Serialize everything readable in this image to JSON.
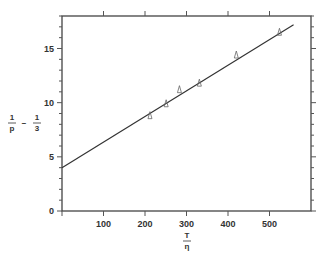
{
  "chart_data": {
    "type": "scatter",
    "title": "",
    "xlabel": {
      "numerator": "T",
      "denominator": "η"
    },
    "ylabel": {
      "term1_num": "1",
      "term1_den": "p",
      "operator": "−",
      "term2_num": "1",
      "term2_den": "3"
    },
    "xlim": [
      0,
      600
    ],
    "ylim": [
      0,
      18
    ],
    "xticks": [
      100,
      200,
      300,
      400,
      500
    ],
    "xtick_labels": [
      "100",
      "200",
      "300",
      "400",
      "500"
    ],
    "yticks": [
      0,
      5,
      10,
      15
    ],
    "ytick_labels": [
      "0",
      "5",
      "10",
      "15"
    ],
    "y_minor_step": 1,
    "grid": false,
    "legend": "none",
    "marker": "triangle-open",
    "series": [
      {
        "name": "measured",
        "x": [
          212,
          251,
          283,
          331,
          420,
          524
        ],
        "y": [
          8.8,
          9.9,
          11.2,
          11.8,
          14.4,
          16.5
        ]
      }
    ],
    "fit_line": {
      "x": [
        0,
        558
      ],
      "y": [
        4.0,
        17.2
      ]
    }
  }
}
